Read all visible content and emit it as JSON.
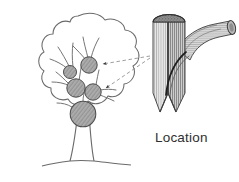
{
  "figure": {
    "type": "line-art illustration",
    "background_color": "#ffffff",
    "ink_color": "#4a4a4a",
    "dark_ink_color": "#2e2e2e",
    "shade_color": "#9a9a9a",
    "labels": {
      "location": "Location"
    },
    "tree": {
      "name": "deciduous tree silhouette",
      "crown_outline": "irregular cloud-like lobed outline",
      "trunk": "tapered vertical trunk meeting ground line",
      "ground_line": "horizontal undulating ground line",
      "branch_collar_count": 4,
      "branch_collars": [
        {
          "id": "collar-1",
          "cx": 70,
          "cy": 72,
          "r": 6.5,
          "label": "branch collar"
        },
        {
          "id": "collar-2",
          "cx": 89,
          "cy": 65,
          "r": 8.5,
          "label": "branch collar"
        },
        {
          "id": "collar-3",
          "cx": 76,
          "cy": 88,
          "r": 9.5,
          "label": "branch collar"
        },
        {
          "id": "collar-4",
          "cx": 93,
          "cy": 92,
          "r": 8.5,
          "label": "branch collar"
        },
        {
          "id": "collar-5",
          "cx": 83,
          "cy": 114,
          "r": 13,
          "label": "branch collar"
        }
      ]
    },
    "callout": {
      "name": "cut-away trunk section",
      "description": "sectioned trunk block with vertical wood grain hatching, elliptical top cap, V-notch base, and a curved branch stub emerging to the upper right",
      "branch_trace": "dark curved line showing branch wood embedded in trunk",
      "leader_lines": 2,
      "leader_style": "dashed with arrowheads pointing at branch collars"
    }
  }
}
